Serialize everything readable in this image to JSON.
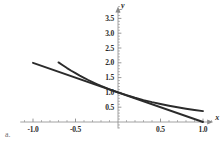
{
  "figure": {
    "part_label": "a.",
    "background_color": "#ffffff",
    "curve_color": "#2b2b2b",
    "axis_color": "#8a8a8a",
    "text_color": "#2b2b2b"
  },
  "chart_data": {
    "type": "line",
    "title": "",
    "subtitle": "",
    "xlabel": "x",
    "ylabel": "y",
    "xlim": [
      -1.15,
      1.12
    ],
    "ylim": [
      -0.22,
      3.9
    ],
    "grid": false,
    "legend": null,
    "axes_style": "centered-cross",
    "xticks": [
      -1.0,
      -0.5,
      0.5,
      1.0
    ],
    "xtick_labels": [
      "-1.0",
      "-0.5",
      "0.5",
      "1.0"
    ],
    "yticks": [
      0.5,
      1.0,
      1.5,
      2.0,
      2.5,
      3.0,
      3.5
    ],
    "ytick_labels": [
      "0.5",
      "1.0",
      "1.5",
      "2.0",
      "2.5",
      "3.0",
      "3.5"
    ],
    "minor_tick_step": 0.1,
    "annotations": [
      "a."
    ],
    "series": [
      {
        "name": "exponential-curve",
        "expression": "y = e^(-x)",
        "color": "#2b2b2b",
        "x": [
          -0.7,
          -0.65,
          -0.6,
          -0.55,
          -0.5,
          -0.45,
          -0.4,
          -0.35,
          -0.3,
          -0.25,
          -0.2,
          -0.15,
          -0.1,
          -0.05,
          0.0,
          0.1,
          0.2,
          0.3,
          0.4,
          0.5,
          0.6,
          0.7,
          0.8,
          0.9,
          1.0
        ],
        "values": [
          2.014,
          1.916,
          1.822,
          1.733,
          1.649,
          1.568,
          1.492,
          1.419,
          1.35,
          1.284,
          1.221,
          1.162,
          1.105,
          1.051,
          1.0,
          0.905,
          0.819,
          0.741,
          0.67,
          0.607,
          0.549,
          0.497,
          0.449,
          0.407,
          0.368
        ]
      },
      {
        "name": "tangent-line",
        "expression": "y = 1 - x",
        "color": "#2b2b2b",
        "x": [
          -1.0,
          1.0
        ],
        "values": [
          2.0,
          0.0
        ]
      }
    ],
    "intersection_point": {
      "x": 0.0,
      "y": 1.0
    }
  }
}
